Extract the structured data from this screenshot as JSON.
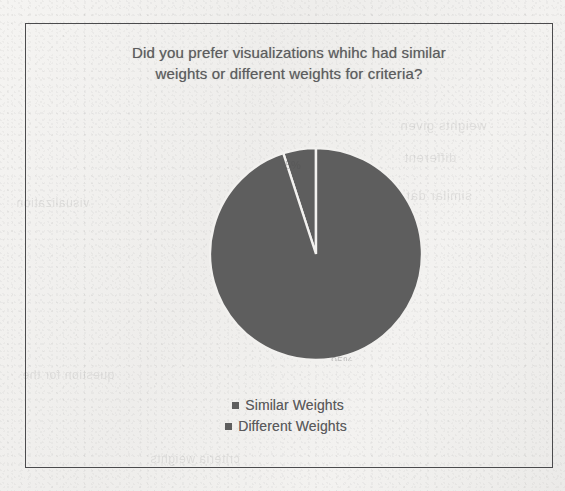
{
  "chart_data": {
    "type": "pie",
    "title": "Did you prefer visualizations whihc had similar weights or different weights for criteria?",
    "title_line_1": "Did you prefer visualizations whihc had similar",
    "title_line_2": "weights or different weights for criteria?",
    "categories": [
      "Similar Weights",
      "Different Weights"
    ],
    "values": [
      5,
      95
    ],
    "value_labels": [
      "5%",
      "95%"
    ],
    "colors": [
      "#5e5e5e",
      "#5e5e5e"
    ],
    "legend_position": "bottom",
    "grid": false,
    "start_angle_deg": 0,
    "xlabel": "",
    "ylabel": ""
  },
  "figure": {
    "border_color": "#4b4b4d",
    "background_color": "#f1f0ee",
    "pie_fill": "#5e5e5e",
    "pie_separator": "#f2f1ef",
    "text_color": "#5a5a5c"
  },
  "legend": {
    "items": [
      {
        "label": "Similar Weights",
        "swatch_color": "#5e5e5e"
      },
      {
        "label": "Different Weights",
        "swatch_color": "#5e5e5e"
      }
    ]
  },
  "bleed_through": {
    "a": "weights given",
    "b": "different",
    "c": "similar data",
    "d": "question for the",
    "e": "visualization",
    "f": "criteria weights"
  }
}
